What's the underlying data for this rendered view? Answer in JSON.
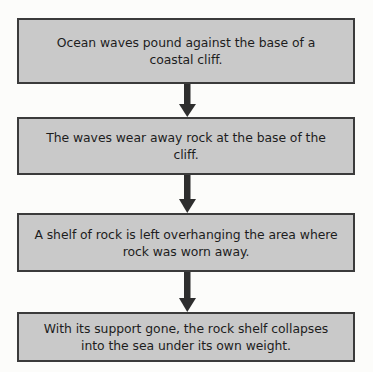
{
  "diagram": {
    "type": "flowchart",
    "orientation": "vertical",
    "colors": {
      "node_fill": "#c9c9c9",
      "node_border": "#3b3b3b",
      "text": "#1d1d1d",
      "arrow": "#2e2e2e",
      "background": "#fcfcfa"
    },
    "nodes": [
      {
        "id": "step-1",
        "text": "Ocean waves pound against the base of a coastal cliff."
      },
      {
        "id": "step-2",
        "text": "The waves wear away rock at the base of the cliff."
      },
      {
        "id": "step-3",
        "text": "A shelf of rock is left overhanging the area where rock was worn away."
      },
      {
        "id": "step-4",
        "text": "With its support gone, the rock shelf collapses into the sea under its own weight."
      }
    ],
    "connectors": [
      {
        "id": "arrow-1-to-2",
        "icon": "arrow-down-icon",
        "from": "step-1",
        "to": "step-2"
      },
      {
        "id": "arrow-2-to-3",
        "icon": "arrow-down-icon",
        "from": "step-2",
        "to": "step-3"
      },
      {
        "id": "arrow-3-to-4",
        "icon": "arrow-down-icon",
        "from": "step-3",
        "to": "step-4"
      }
    ]
  }
}
